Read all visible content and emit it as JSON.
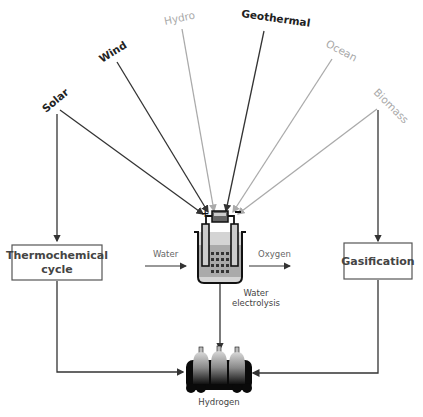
{
  "sources": {
    "solar": {
      "label": "Solar",
      "tone": "dark"
    },
    "wind": {
      "label": "Wind",
      "tone": "dark"
    },
    "hydro": {
      "label": "Hydro",
      "tone": "light"
    },
    "geothermal": {
      "label": "Geothermal",
      "tone": "dark"
    },
    "ocean": {
      "label": "Ocean",
      "tone": "light"
    },
    "biomass": {
      "label": "Biomass",
      "tone": "light"
    }
  },
  "processes": {
    "thermochemical_line1": "Thermochemical",
    "thermochemical_line2": "cycle",
    "gasification": "Gasification",
    "electrolysis_line1": "Water",
    "electrolysis_line2": "electrolysis"
  },
  "flows": {
    "water_in": "Water",
    "oxygen_out": "Oxygen"
  },
  "product": {
    "label": "Hydrogen"
  },
  "colors": {
    "dark_line": "#333333",
    "light_line": "#aaaaaa",
    "box_border": "#555555"
  }
}
